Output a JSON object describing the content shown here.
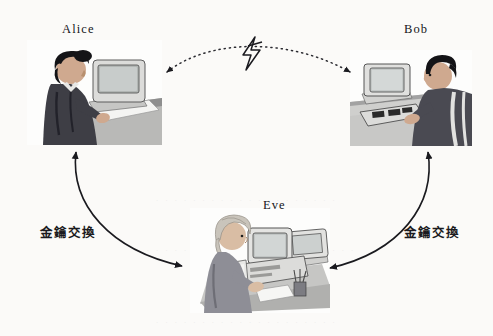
{
  "diagram": {
    "title_visible": false,
    "background_color": "#fbfaf8",
    "ink_color": "#15151a",
    "nodes": [
      {
        "id": "alice",
        "label": "Alice",
        "role": "sender",
        "position": "top-left",
        "scene": "woman-at-computer",
        "hair_color": "#141417",
        "clothing_color": "#3e3e45",
        "monitor_color": "#d8d8d6"
      },
      {
        "id": "bob",
        "label": "Bob",
        "role": "receiver",
        "position": "top-right",
        "scene": "man-at-computer",
        "hair_color": "#141417",
        "clothing_color": "#4a4a52",
        "monitor_color": "#dededc"
      },
      {
        "id": "eve",
        "label": "Eve",
        "role": "eavesdropper",
        "position": "bottom-center",
        "scene": "person-at-two-computers",
        "hair_color": "#c9c4bb",
        "clothing_color": "#8e8e96",
        "monitor_color": "#e2e2e0"
      }
    ],
    "connections": [
      {
        "id": "alice-eve",
        "from": "alice",
        "to": "eve",
        "label": "金鑰交換",
        "style": "solid-curved",
        "arrowheads": "both"
      },
      {
        "id": "bob-eve",
        "from": "bob",
        "to": "eve",
        "label": "金鑰交換",
        "style": "solid-curved",
        "arrowheads": "both"
      },
      {
        "id": "alice-bob",
        "from": "alice",
        "to": "bob",
        "label": "",
        "style": "dotted-arc",
        "arrowheads": "both",
        "marker": "lightning-bolt"
      }
    ],
    "bleed_text": [
      "· · · · · · · · · · · · · · · · · · · ·",
      "· · · · · · · · · · · · · · · · · · · · · · · ·",
      "· · · · · · · · · · · · · · · · · · · ·"
    ]
  }
}
